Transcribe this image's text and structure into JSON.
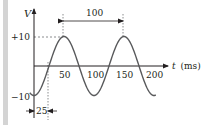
{
  "chart_data": {
    "type": "line",
    "title": "",
    "xlabel": "t (ms)",
    "ylabel": "V",
    "x_ticks": [
      50,
      100,
      150,
      200
    ],
    "y_ticks": [
      10,
      -10
    ],
    "y_tick_labels": [
      "+10",
      "−10"
    ],
    "x_tick_labels": [
      "50",
      "100",
      "150",
      "200"
    ],
    "series": [
      {
        "name": "V(t)",
        "function": "10*sin(2*pi*(t-25)/100)",
        "amplitude": 10,
        "period_ms": 100,
        "phase_shift_ms": 25,
        "x": [
          0,
          25,
          50,
          75,
          100,
          125,
          150,
          175,
          200
        ],
        "values": [
          -10,
          0,
          10,
          0,
          -10,
          0,
          10,
          0,
          -10
        ]
      }
    ],
    "annotations": [
      {
        "label": "100",
        "type": "dimension",
        "from_t": 50,
        "to_t": 150,
        "meaning": "period"
      },
      {
        "label": "25",
        "type": "dimension",
        "from_t": 0,
        "to_t": 25,
        "meaning": "time offset"
      }
    ],
    "xlim": [
      0,
      200
    ],
    "ylim": [
      -10,
      10
    ],
    "grid": false,
    "legend": "none",
    "colors": {
      "curve": "#58595b",
      "axes": "#231f20",
      "guides": "#6d6e71",
      "sidebar": "#d4d4d4"
    }
  },
  "labels": {
    "y_axis": "V",
    "x_axis_var": "t",
    "x_axis_unit": "(ms)",
    "y_plus": "+10",
    "y_minus": "−10",
    "tick_50": "50",
    "tick_100": "100",
    "tick_150": "150",
    "tick_200": "200",
    "period": "100",
    "offset": "25"
  }
}
